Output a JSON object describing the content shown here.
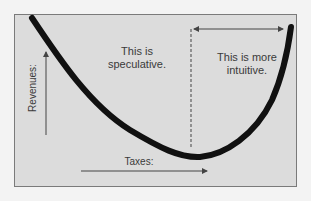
{
  "diagram": {
    "type": "laffer-curve-sketch",
    "colors": {
      "background": "#f3f3f3",
      "panel": "#dcdcdc",
      "border": "#7a7a7a",
      "curve": "#111111",
      "arrows": "#444444",
      "text": "#3a3a3a"
    },
    "labels": {
      "left_region": "This is speculative.",
      "right_region": "This is more intuitive.",
      "x_axis": "Taxes:",
      "y_axis": "Revenues:"
    },
    "elements": {
      "curve": "U-shaped thick black curve descending from top-left to a minimum near the lower right, then rising steeply to the top-right",
      "divider": "dashed vertical line at curve minimum",
      "span_arrow": "double-headed horizontal arrow spanning the right region",
      "x_arrow": "rightward arrow under Taxes label",
      "y_arrow": "upward arrow beside Revenues label"
    }
  }
}
